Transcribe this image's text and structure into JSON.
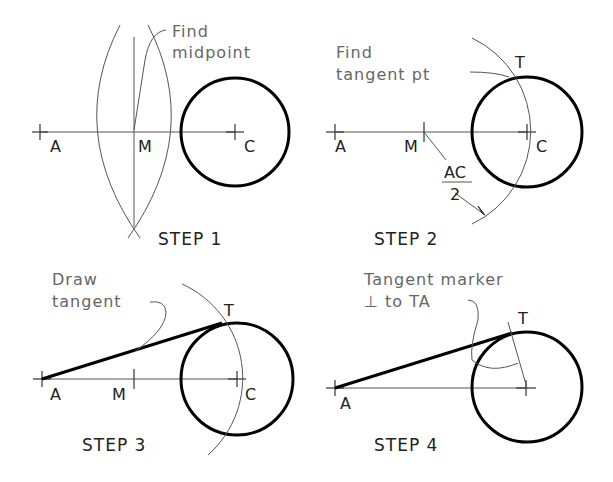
{
  "panels": [
    {
      "step": "STEP 1",
      "note_line1": "Find",
      "note_line2": "midpoint",
      "labels": {
        "a": "A",
        "m": "M",
        "c": "C"
      }
    },
    {
      "step": "STEP 2",
      "note_line1": "Find",
      "note_line2": "tangent pt",
      "labels": {
        "a": "A",
        "m": "M",
        "c": "C",
        "t": "T",
        "frac_num": "AC",
        "frac_den": "2"
      }
    },
    {
      "step": "STEP 3",
      "note_line1": "Draw",
      "note_line2": "tangent",
      "labels": {
        "a": "A",
        "m": "M",
        "c": "C",
        "t": "T"
      }
    },
    {
      "step": "STEP 4",
      "note_line1": "Tangent marker",
      "note_line2": "⊥ to TA",
      "labels": {
        "a": "A",
        "t": "T"
      }
    }
  ]
}
